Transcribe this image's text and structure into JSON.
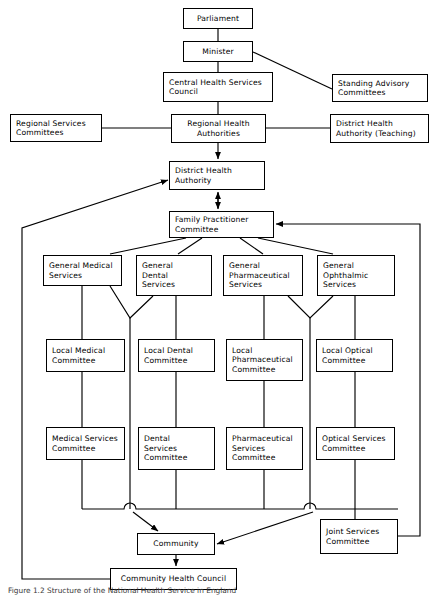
{
  "figure": {
    "caption": "Figure 1.2 Structure of the National Health Service in England",
    "type": "organisational-chart"
  },
  "nodes": [
    {
      "id": "parliament",
      "lines": [
        "Parliament"
      ],
      "align": "center",
      "x": 183,
      "y": 8,
      "w": 70,
      "h": 21
    },
    {
      "id": "minister",
      "lines": [
        "Minister"
      ],
      "align": "center",
      "x": 183,
      "y": 41,
      "w": 70,
      "h": 21
    },
    {
      "id": "central-health-services-council",
      "lines": [
        "Central Health Services",
        "Council"
      ],
      "align": "left",
      "x": 163,
      "y": 72,
      "w": 110,
      "h": 30
    },
    {
      "id": "standing-advisory-committees",
      "lines": [
        "Standing Advisory",
        "Committees"
      ],
      "align": "left",
      "x": 332,
      "y": 74,
      "w": 96,
      "h": 28
    },
    {
      "id": "regional-health-authorities",
      "lines": [
        "Regional Health",
        "Authorities"
      ],
      "align": "center",
      "x": 171,
      "y": 114,
      "w": 95,
      "h": 29
    },
    {
      "id": "regional-services-committees",
      "lines": [
        "Regional Services",
        "Committees"
      ],
      "align": "left",
      "x": 10,
      "y": 114,
      "w": 92,
      "h": 28
    },
    {
      "id": "district-health-authority-teaching",
      "lines": [
        "District Health",
        "Authority (Teaching)"
      ],
      "align": "left",
      "x": 330,
      "y": 114,
      "w": 99,
      "h": 29
    },
    {
      "id": "district-health-authority",
      "lines": [
        "District Health",
        "Authority"
      ],
      "align": "left",
      "x": 169,
      "y": 161,
      "w": 96,
      "h": 29
    },
    {
      "id": "family-practitioner-committee",
      "lines": [
        "Family Practitioner",
        "Committee"
      ],
      "align": "left",
      "x": 169,
      "y": 211,
      "w": 105,
      "h": 27
    },
    {
      "id": "general-medical-services",
      "lines": [
        "General Medical",
        "Services"
      ],
      "align": "left",
      "x": 43,
      "y": 255,
      "w": 79,
      "h": 31
    },
    {
      "id": "general-dental-services",
      "lines": [
        "General",
        "Dental",
        "Services"
      ],
      "align": "left",
      "x": 136,
      "y": 255,
      "w": 76,
      "h": 41
    },
    {
      "id": "general-pharmaceutical-services",
      "lines": [
        "General",
        "Pharmaceutical",
        "Services"
      ],
      "align": "left",
      "x": 223,
      "y": 255,
      "w": 80,
      "h": 41
    },
    {
      "id": "general-ophthalmic-services",
      "lines": [
        "General",
        "Ophthalmic",
        "Services"
      ],
      "align": "left",
      "x": 317,
      "y": 255,
      "w": 78,
      "h": 41
    },
    {
      "id": "local-medical-committee",
      "lines": [
        "Local Medical",
        "Committee"
      ],
      "align": "left",
      "x": 46,
      "y": 339,
      "w": 79,
      "h": 33
    },
    {
      "id": "local-dental-committee",
      "lines": [
        "Local Dental",
        "Committee"
      ],
      "align": "left",
      "x": 138,
      "y": 339,
      "w": 77,
      "h": 33
    },
    {
      "id": "local-pharmaceutical-committee",
      "lines": [
        "Local",
        "Pharmaceutical",
        "Committee"
      ],
      "align": "left",
      "x": 226,
      "y": 339,
      "w": 77,
      "h": 42
    },
    {
      "id": "local-optical-committee",
      "lines": [
        "Local Optical",
        "Committee"
      ],
      "align": "left",
      "x": 316,
      "y": 339,
      "w": 77,
      "h": 33
    },
    {
      "id": "medical-services-committee",
      "lines": [
        "Medical Services",
        "Committee"
      ],
      "align": "left",
      "x": 46,
      "y": 427,
      "w": 79,
      "h": 33
    },
    {
      "id": "dental-services-committee",
      "lines": [
        "Dental",
        "Services",
        "Committee"
      ],
      "align": "left",
      "x": 138,
      "y": 427,
      "w": 77,
      "h": 43
    },
    {
      "id": "pharmaceutical-services-committee",
      "lines": [
        "Pharmaceutical",
        "Services",
        "Committee"
      ],
      "align": "left",
      "x": 226,
      "y": 427,
      "w": 77,
      "h": 43
    },
    {
      "id": "optical-services-committee",
      "lines": [
        "Optical Services",
        "Committee"
      ],
      "align": "left",
      "x": 316,
      "y": 427,
      "w": 79,
      "h": 33
    },
    {
      "id": "community",
      "lines": [
        "Community"
      ],
      "align": "center",
      "x": 137,
      "y": 533,
      "w": 78,
      "h": 22
    },
    {
      "id": "joint-services-committee",
      "lines": [
        "Joint Services",
        "Committee"
      ],
      "align": "left",
      "x": 320,
      "y": 519,
      "w": 78,
      "h": 35
    },
    {
      "id": "community-health-council",
      "lines": [
        "Community Health Council"
      ],
      "align": "center",
      "x": 110,
      "y": 568,
      "w": 127,
      "h": 22
    }
  ],
  "edges": [
    {
      "from": "parliament",
      "to": "minister",
      "kind": "line"
    },
    {
      "from": "minister",
      "to": "central-health-services-council",
      "kind": "line"
    },
    {
      "from": "minister",
      "to": "standing-advisory-committees",
      "kind": "diagonal"
    },
    {
      "from": "central-health-services-council",
      "to": "regional-health-authorities",
      "kind": "line"
    },
    {
      "from": "regional-services-committees",
      "to": "regional-health-authorities",
      "kind": "line"
    },
    {
      "from": "regional-health-authorities",
      "to": "district-health-authority-teaching",
      "kind": "line"
    },
    {
      "from": "regional-health-authorities",
      "to": "district-health-authority",
      "kind": "arrow"
    },
    {
      "from": "district-health-authority",
      "to": "family-practitioner-committee",
      "kind": "double-arrow"
    },
    {
      "from": "family-practitioner-committee",
      "to": "general-medical-services",
      "kind": "diagonal"
    },
    {
      "from": "family-practitioner-committee",
      "to": "general-dental-services",
      "kind": "diagonal"
    },
    {
      "from": "family-practitioner-committee",
      "to": "general-pharmaceutical-services",
      "kind": "diagonal"
    },
    {
      "from": "family-practitioner-committee",
      "to": "general-ophthalmic-services",
      "kind": "diagonal"
    },
    {
      "from": "general-medical-services",
      "to": "local-medical-committee",
      "kind": "line"
    },
    {
      "from": "general-dental-services",
      "to": "local-dental-committee",
      "kind": "line"
    },
    {
      "from": "general-pharmaceutical-services",
      "to": "local-pharmaceutical-committee",
      "kind": "line"
    },
    {
      "from": "general-ophthalmic-services",
      "to": "local-optical-committee",
      "kind": "line"
    },
    {
      "from": "local-medical-committee",
      "to": "medical-services-committee",
      "kind": "line"
    },
    {
      "from": "local-dental-committee",
      "to": "dental-services-committee",
      "kind": "line"
    },
    {
      "from": "local-pharmaceutical-committee",
      "to": "pharmaceutical-services-committee",
      "kind": "line"
    },
    {
      "from": "local-optical-committee",
      "to": "optical-services-committee",
      "kind": "line"
    },
    {
      "from": "services",
      "to": "community",
      "kind": "arrow"
    },
    {
      "from": "joint-services-committee",
      "to": "family-practitioner-committee",
      "kind": "arrow"
    },
    {
      "from": "community",
      "to": "community-health-council",
      "kind": "arrow"
    },
    {
      "from": "community-health-council",
      "to": "district-health-authority",
      "kind": "arrow"
    }
  ],
  "colors": {
    "line": "#000000",
    "box_fill": "#ffffff",
    "text": "#000000",
    "caption_text": "#3a3a3a",
    "background": "#ffffff"
  }
}
